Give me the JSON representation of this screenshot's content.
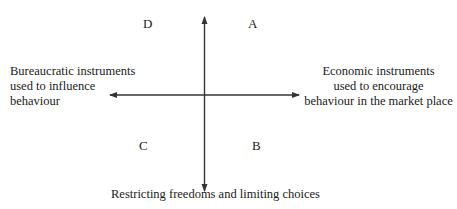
{
  "diagram": {
    "type": "quadrant",
    "quadrants": {
      "top_right": "A",
      "bottom_right": "B",
      "bottom_left": "C",
      "top_left": "D"
    },
    "axes": {
      "left_label": [
        "Bureaucratic instruments",
        "used to influence",
        "behaviour"
      ],
      "right_label": [
        "Economic instruments",
        "used to encourage",
        "behaviour in the market place"
      ],
      "bottom_label": "Restricting freedoms and limiting choices",
      "top_label": ""
    },
    "colors": {
      "line": "#333333",
      "text": "#1a1a1a"
    }
  }
}
